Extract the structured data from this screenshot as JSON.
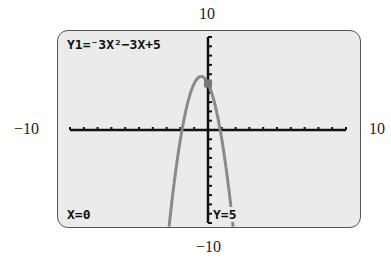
{
  "window": {
    "ymax_label": "10",
    "ymin_label": "−10",
    "xmin_label": "−10",
    "xmax_label": "10"
  },
  "calculator_screen": {
    "equation": "Y1=⁻3X²−3X+5",
    "cursor_x": "X=0",
    "cursor_y": "Y=5"
  },
  "chart_data": {
    "type": "line",
    "function": "-3x^2-3x+5",
    "xlim": [
      -10,
      10
    ],
    "ylim": [
      -10,
      10
    ],
    "xscl": 1,
    "yscl": 1,
    "trace_point": {
      "x": 0,
      "y": 5
    },
    "grid": false,
    "axis_color": "#111111",
    "curve_color": "#8a8a8a"
  }
}
